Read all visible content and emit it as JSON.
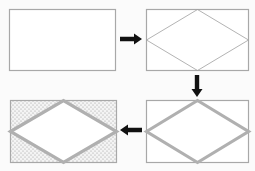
{
  "diagram": {
    "type": "process-flow",
    "background": "#fbfbfb",
    "colors": {
      "box_border": "#a8a8a8",
      "thin_line": "#a0a0a0",
      "thick_line": "#b0b0b0",
      "arrow": "#111111",
      "dot": "#9a9a9a",
      "fill": "#ffffff"
    },
    "steps": [
      {
        "id": "step-1",
        "label": "Empty rectangle",
        "box": {
          "x": 9.5,
          "y": 9.5,
          "w": 106,
          "h": 61
        },
        "diamond": "none",
        "fill": "none"
      },
      {
        "id": "step-2",
        "label": "Rectangle with thin inscribed diamond",
        "box": {
          "x": 146.5,
          "y": 9.5,
          "w": 102,
          "h": 61
        },
        "diamond": "thin",
        "fill": "none"
      },
      {
        "id": "step-3",
        "label": "Rectangle with thick diamond outline",
        "box": {
          "x": 146.5,
          "y": 100.5,
          "w": 102,
          "h": 62
        },
        "diamond": "thick",
        "fill": "none"
      },
      {
        "id": "step-4",
        "label": "Rectangle with thick diamond and dotted background",
        "box": {
          "x": 10.5,
          "y": 100.5,
          "w": 106,
          "h": 62
        },
        "diamond": "thick",
        "fill": "dotted-outside"
      }
    ],
    "arrows": [
      {
        "id": "arrow-1-to-2",
        "direction": "right",
        "from": [
          120,
          39
        ],
        "to": [
          142,
          39
        ]
      },
      {
        "id": "arrow-2-to-3",
        "direction": "down",
        "from": [
          197,
          75
        ],
        "to": [
          197,
          97
        ]
      },
      {
        "id": "arrow-3-to-4",
        "direction": "left",
        "from": [
          142,
          130
        ],
        "to": [
          120,
          130
        ]
      }
    ]
  }
}
